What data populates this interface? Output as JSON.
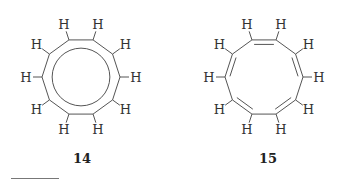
{
  "figure": {
    "molecules": [
      {
        "id": "14",
        "label": "14",
        "atoms": "C10H10",
        "ring_size": 10,
        "representation": "delocalized ring (inner circle)",
        "hydrogen_label": "H",
        "hydrogen_count": 10
      },
      {
        "id": "15",
        "label": "15",
        "atoms": "C10H10",
        "ring_size": 10,
        "representation": "alternating double bonds (Kekulé)",
        "hydrogen_label": "H",
        "hydrogen_count": 10
      }
    ],
    "colors": {
      "bond": "#555555",
      "text": "#222222"
    }
  }
}
